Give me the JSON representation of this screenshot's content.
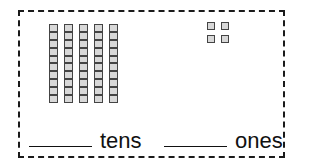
{
  "worksheet": {
    "tens_label": "tens",
    "ones_label": "ones",
    "tens_answer": "",
    "ones_answer": "",
    "tens_rods_count": 5,
    "cells_per_rod": 10,
    "ones_cubes_count": 4,
    "frame_style": "dashed",
    "colors": {
      "outline": "#1a1a1a",
      "block_fill": "#d8d8d8",
      "block_border": "#444444"
    }
  }
}
